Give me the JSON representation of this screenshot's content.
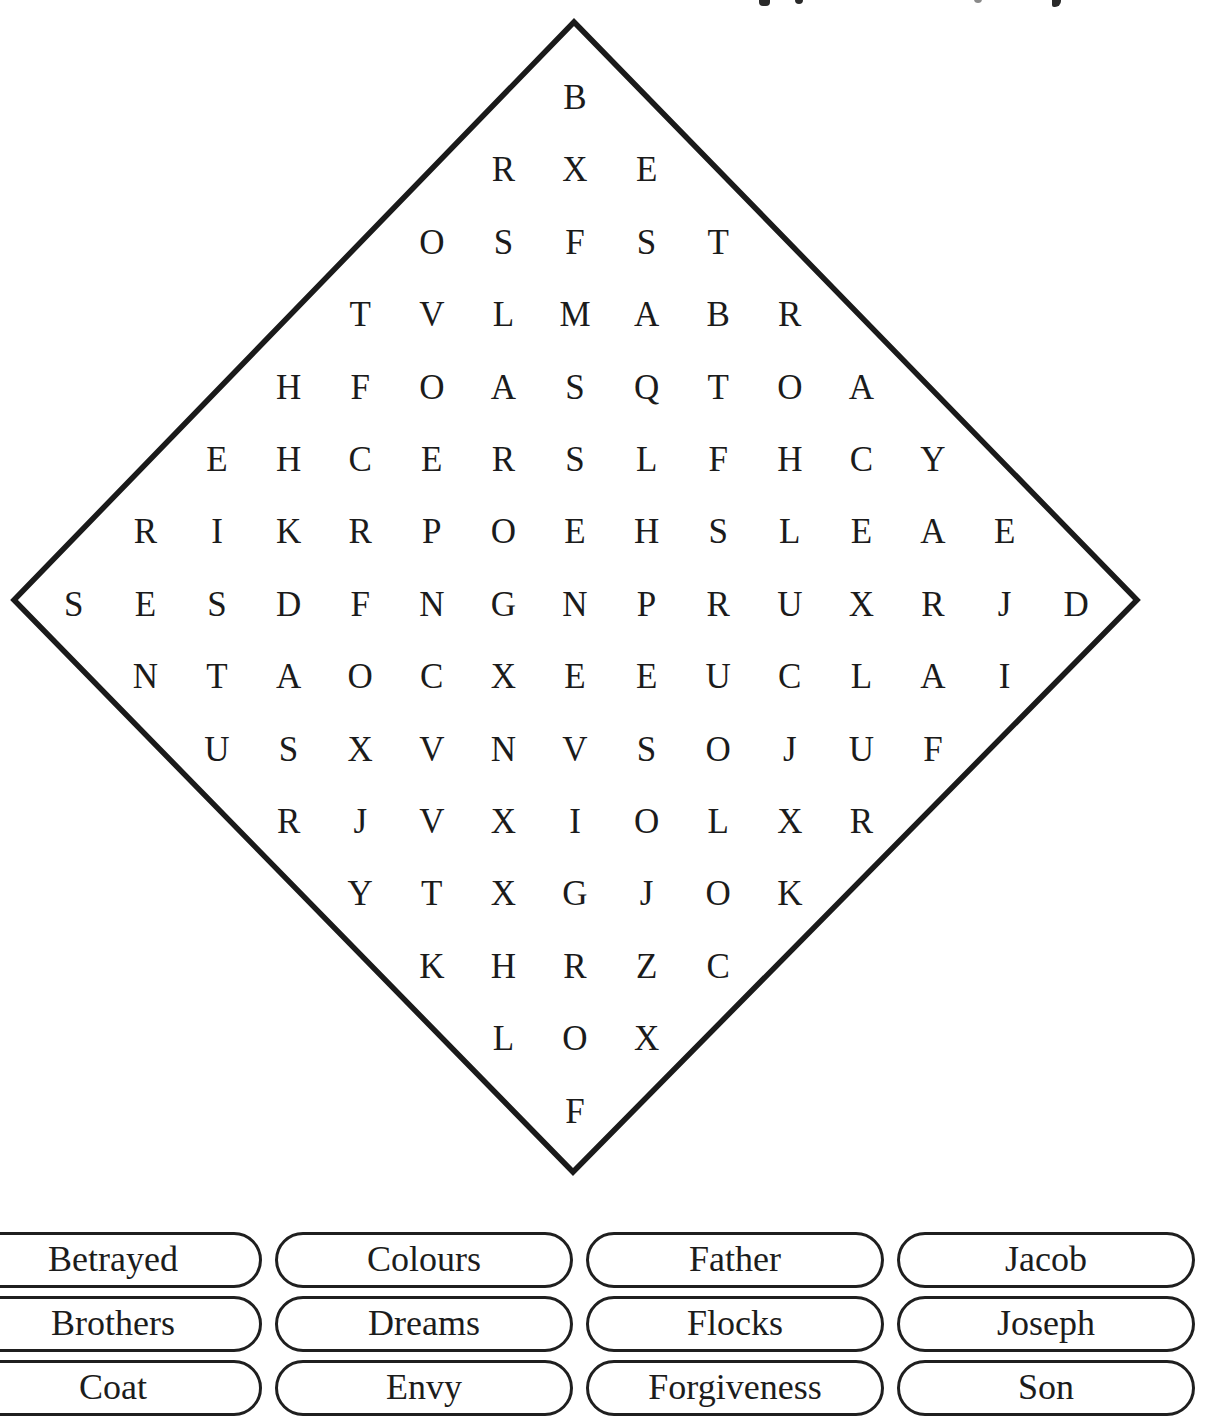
{
  "puzzle": {
    "shape": "diamond",
    "outline_color": "#1a1a1a",
    "letter_color": "#1b1b1b",
    "rows": [
      "B",
      "RXE",
      "OSFST",
      "TVLMABR",
      "HFOASQTOA",
      "EHCERSLFHCY",
      "RIKRPOEHSLEAE",
      "SESDFNGNPRUXRJD",
      "NTAOCXEEUCLAI",
      "USXVNVSOJUF",
      "RJVXIOLXR",
      "YTXGJOK",
      "KHRZC",
      "LOX",
      "F"
    ]
  },
  "word_bank": {
    "words": [
      "Betrayed",
      "Colours",
      "Father",
      "Jacob",
      "Brothers",
      "Dreams",
      "Flocks",
      "Joseph",
      "Coat",
      "Envy",
      "Forgiveness",
      "Son"
    ]
  }
}
